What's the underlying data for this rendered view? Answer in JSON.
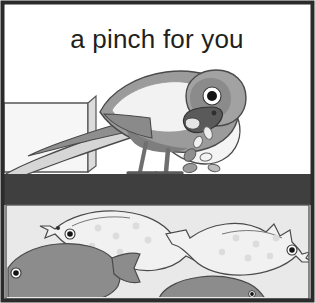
{
  "illustration": {
    "caption": "a pinch for you",
    "alt_summary": "A grey parrot perched on the rim of a fish tank drops food crumbs to the fish below",
    "palette": {
      "frame_border": "#2b2b2b",
      "background": "#ffffff",
      "tank_rim_dark": "#3f3f3f",
      "water_background": "#e8e8e8",
      "bird_body_mid_grey": "#9b9b9b",
      "bird_wing_highlight": "#f2f2f2",
      "bird_head_grey": "#8d8d8d",
      "bird_beak_dark": "#4f4f4f",
      "bird_eye_white": "#ffffff",
      "bird_eye_pupil": "#111111",
      "fish_light": "#eeeeee",
      "fish_dark": "#8a8a8a",
      "crumb_light": "#f0f0f0",
      "crumb_dark": "#8f8f8f",
      "outline": "#3a3a3a",
      "shelf_fill": "#f4f4f4"
    },
    "scene": {
      "panel_label": "comic-panel",
      "title_band_label": "caption-band",
      "upper_region_label": "air-above-tank",
      "rim_band_label": "tank-rim",
      "lower_region_label": "tank-water"
    },
    "subjects": {
      "bird": {
        "name": "parrot",
        "pose": "bending down over tank rim",
        "parts": [
          "tail",
          "wing",
          "body",
          "head",
          "eye",
          "beak",
          "legs",
          "feet"
        ]
      },
      "crumbs": {
        "name": "food-crumbs",
        "count": 6
      },
      "fish": [
        {
          "name": "fish-upper-left",
          "tone": "light",
          "facing": "left",
          "spots": 6
        },
        {
          "name": "fish-right",
          "tone": "light",
          "facing": "right",
          "spots": 6
        },
        {
          "name": "fish-lower-left",
          "tone": "dark",
          "facing": "left",
          "spots": 0
        },
        {
          "name": "fish-bottom-middle",
          "tone": "dark",
          "facing": "right",
          "spots": 0
        }
      ],
      "shelf": {
        "name": "table-box",
        "description": "rectangular box at left under the bird tail"
      }
    }
  }
}
